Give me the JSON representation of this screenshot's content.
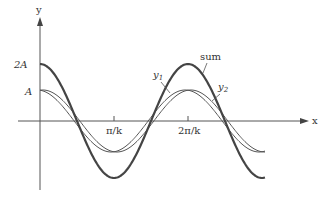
{
  "diagram": {
    "axes": {
      "x_label": "x",
      "y_label": "y",
      "x_ticks": [
        "π/k",
        "2π/k"
      ],
      "y_ticks": [
        "2A",
        "A"
      ]
    },
    "curves": [
      {
        "name": "sum",
        "label": "sum",
        "amplitude": "2A",
        "color": "#444444",
        "weight": "thick"
      },
      {
        "name": "y1",
        "label": "y",
        "sub": "1",
        "amplitude": "A",
        "color": "#555555",
        "weight": "thin"
      },
      {
        "name": "y2",
        "label": "y",
        "sub": "2",
        "amplitude": "A",
        "color": "#555555",
        "weight": "thin"
      }
    ],
    "colors": {
      "axis": "#555555",
      "text": "#333333",
      "background": "#ffffff"
    }
  }
}
